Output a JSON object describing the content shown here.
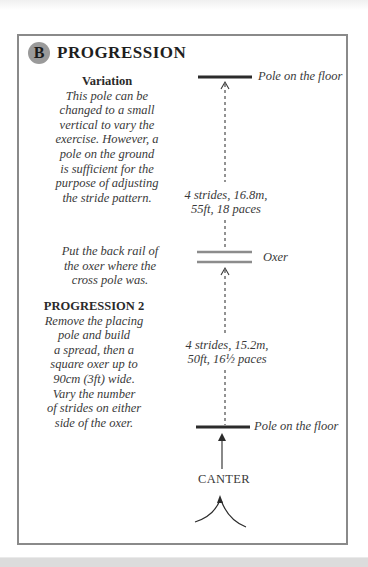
{
  "section": {
    "badge": "B",
    "title": "PROGRESSION"
  },
  "variation": {
    "heading": "Variation",
    "lines": [
      "This pole can be",
      "changed to a small",
      "vertical to vary the",
      "exercise. However, a",
      "pole on the ground",
      "is sufficient for the",
      "purpose of adjusting",
      "the stride pattern."
    ]
  },
  "back_rail_note": {
    "lines": [
      "Put the back rail of",
      "the oxer where the",
      "cross pole was."
    ]
  },
  "progression2": {
    "heading": "PROGRESSION 2",
    "lines": [
      "Remove the placing",
      "pole and build",
      "a spread, then a",
      "square oxer up to",
      "90cm (3ft) wide.",
      "Vary the number",
      "of strides on either",
      "side of the oxer."
    ]
  },
  "diagram": {
    "top_pole_label": "Pole on the floor",
    "distance_upper": [
      "4 strides, 16.8m,",
      "55ft, 18 paces"
    ],
    "oxer_label": "Oxer",
    "distance_lower": [
      "4 strides, 15.2m,",
      "50ft, 16½ paces"
    ],
    "bottom_pole_label": "Pole on the floor",
    "approach_label": "CANTER",
    "colors": {
      "pole": "#2b2b2b",
      "oxer_rail": "#8c8c8c",
      "border": "#8a8a8a",
      "badge": "#9a9a9a"
    }
  }
}
